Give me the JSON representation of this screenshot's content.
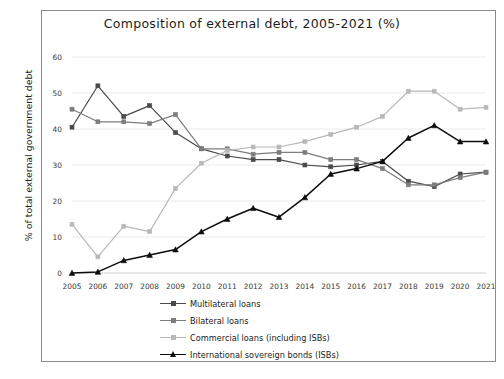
{
  "chart_data": {
    "type": "line",
    "title": "Composition of external debt, 2005-2021  (%)",
    "xlabel": "",
    "ylabel": "% of total external government debt",
    "ylim": [
      0,
      60
    ],
    "yticks": [
      0,
      10,
      20,
      30,
      40,
      50,
      60
    ],
    "grid": true,
    "legend_position": "bottom",
    "categories": [
      "2005",
      "2006",
      "2007",
      "2008",
      "2009",
      "2010",
      "2011",
      "2012",
      "2013",
      "2014",
      "2015",
      "2016",
      "2017",
      "2018",
      "2019",
      "2020",
      "2021"
    ],
    "series": [
      {
        "name": "Multilateral loans",
        "color": "#4a4a4a",
        "marker": "square",
        "values": [
          40.5,
          52.0,
          43.5,
          46.5,
          39.0,
          34.5,
          32.5,
          31.5,
          31.5,
          30.0,
          29.5,
          30.0,
          31.0,
          25.5,
          24.0,
          27.5,
          28.0
        ]
      },
      {
        "name": "Bilateral loans",
        "color": "#7d7d7d",
        "marker": "square",
        "values": [
          45.5,
          42.0,
          42.0,
          41.5,
          44.0,
          34.5,
          34.5,
          33.0,
          33.5,
          33.5,
          31.5,
          31.5,
          29.0,
          24.5,
          24.5,
          26.5,
          28.0
        ]
      },
      {
        "name": "Commercial loans (including ISBs)",
        "color": "#b8b8b8",
        "marker": "square",
        "values": [
          13.5,
          4.5,
          13.0,
          11.5,
          23.5,
          30.5,
          34.0,
          35.0,
          35.0,
          36.5,
          38.5,
          40.5,
          43.5,
          50.5,
          50.5,
          45.5,
          46.0
        ]
      },
      {
        "name": "International sovereign bonds (ISBs)",
        "color": "#0d0d0d",
        "marker": "triangle",
        "values": [
          0.0,
          0.3,
          3.5,
          5.0,
          6.5,
          11.5,
          15.0,
          18.0,
          15.5,
          21.0,
          27.5,
          29.0,
          31.0,
          37.5,
          41.0,
          36.5,
          36.5
        ]
      }
    ]
  }
}
